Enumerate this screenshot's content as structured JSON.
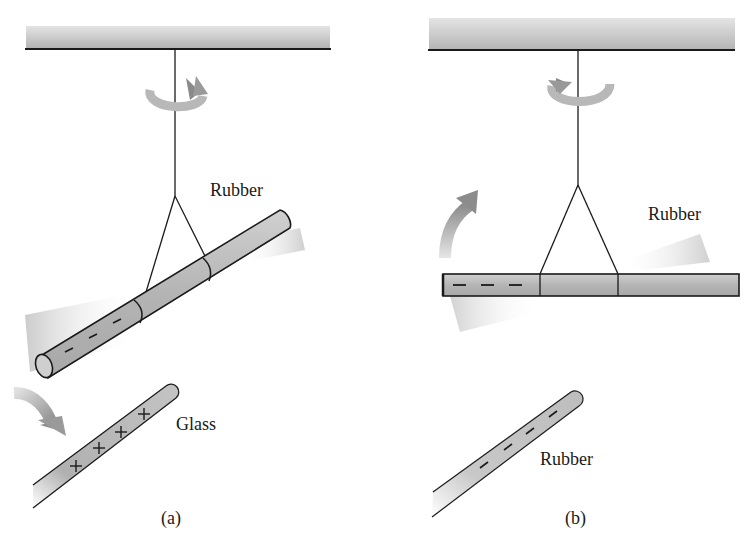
{
  "figure": {
    "panels": [
      {
        "id": "a",
        "caption": "(a)",
        "suspended_rod": {
          "material": "Rubber",
          "charge_sign": "−",
          "charge_marks": [
            "−",
            "−",
            "−"
          ]
        },
        "held_rod": {
          "material": "Glass",
          "charge_sign": "+",
          "charge_marks": [
            "+",
            "+",
            "+",
            "+"
          ]
        },
        "motion": "attraction"
      },
      {
        "id": "b",
        "caption": "(b)",
        "suspended_rod": {
          "material": "Rubber",
          "charge_sign": "−",
          "charge_marks": [
            "−",
            "−",
            "−"
          ]
        },
        "held_rod": {
          "material": "Rubber",
          "charge_sign": "−",
          "charge_marks": [
            "−",
            "−",
            "−",
            "−"
          ]
        },
        "motion": "repulsion"
      }
    ],
    "colors": {
      "rod_fill": "#b8b8b8",
      "rod_outline": "#1a1a1a",
      "ceiling_shade": "#bdbdbd",
      "arrow": "#9a9a9a",
      "blur": "#d6d6d6"
    }
  }
}
